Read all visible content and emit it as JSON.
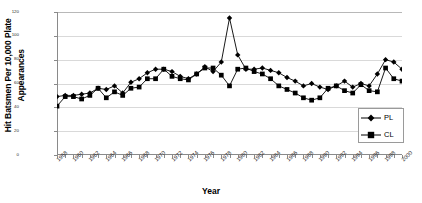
{
  "chart_data": {
    "type": "line",
    "title": "",
    "xlabel": "Year",
    "ylabel": "Hit Batsmen Per 10,000 Plate Appearances",
    "ylabel_line1": "Hit Batsmen Per 10,000 Plate",
    "ylabel_line2": "Appearances",
    "ylim": [
      0,
      120
    ],
    "yticks": [
      0,
      20,
      40,
      60,
      80,
      100,
      120
    ],
    "ytick_labels": [
      "0",
      "20",
      "40",
      "60",
      "80",
      "100",
      "120"
    ],
    "xlim": [
      1958,
      2000
    ],
    "xtick_labels": [
      "1958",
      "1960",
      "1962",
      "1964",
      "1966",
      "1968",
      "1970",
      "1972",
      "1974",
      "1976",
      "1978",
      "1980",
      "1982",
      "1984",
      "1986",
      "1988",
      "1990",
      "1992",
      "1994",
      "1996",
      "1998",
      "2000"
    ],
    "grid": "horizontal",
    "legend_position": "lower-right",
    "marker_color": "#000000",
    "line_color": "#000000",
    "x": [
      1958,
      1959,
      1960,
      1961,
      1962,
      1963,
      1964,
      1965,
      1966,
      1967,
      1968,
      1969,
      1970,
      1971,
      1972,
      1973,
      1974,
      1975,
      1976,
      1977,
      1978,
      1979,
      1980,
      1981,
      1982,
      1983,
      1984,
      1985,
      1986,
      1987,
      1988,
      1989,
      1990,
      1991,
      1992,
      1993,
      1994,
      1995,
      1996,
      1997,
      1998,
      1999,
      2000
    ],
    "series": [
      {
        "name": "PL",
        "marker": "diamond",
        "values": [
          49,
          50,
          50,
          51,
          52,
          56,
          55,
          58,
          52,
          61,
          64,
          69,
          72,
          72,
          70,
          66,
          64,
          68,
          74,
          70,
          78,
          115,
          84,
          72,
          72,
          73,
          71,
          69,
          65,
          62,
          58,
          60,
          57,
          55,
          58,
          62,
          57,
          60,
          58,
          68,
          80,
          78,
          72
        ]
      },
      {
        "name": "CL",
        "marker": "square",
        "values": [
          41,
          49,
          49,
          47,
          50,
          56,
          48,
          53,
          50,
          56,
          57,
          64,
          64,
          72,
          66,
          64,
          63,
          68,
          73,
          73,
          67,
          58,
          72,
          73,
          70,
          68,
          64,
          58,
          55,
          52,
          48,
          46,
          48,
          56,
          58,
          54,
          52,
          59,
          54,
          53,
          73,
          64,
          62
        ]
      }
    ],
    "legend": [
      {
        "label": "PL",
        "marker": "diamond"
      },
      {
        "label": "CL",
        "marker": "square"
      }
    ]
  }
}
